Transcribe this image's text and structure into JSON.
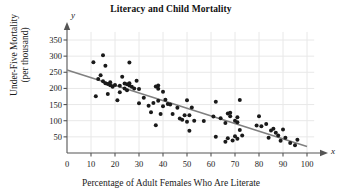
{
  "chart_data": {
    "type": "scatter",
    "title": "Literacy and Child Mortality",
    "xlabel": "Percentage of Adult Females Who Are Literate",
    "ylabel_line1": "Under-Five Mortality",
    "ylabel_line2": "(per thousand)",
    "x_axis_letter": "x",
    "y_axis_letter": "y",
    "xlim": [
      0,
      100
    ],
    "ylim": [
      0,
      375
    ],
    "xticks": [
      0,
      10,
      20,
      30,
      40,
      50,
      60,
      70,
      80,
      90,
      100
    ],
    "yticks": [
      50,
      100,
      150,
      200,
      250,
      300,
      350
    ],
    "grid": true,
    "legend": "none",
    "point_color": "#1a1a1a",
    "line_color": "#808080",
    "grid_color": "#e8e8e8",
    "axis_color": "#555555",
    "trendline": {
      "label": "least-squares regression line",
      "x": [
        0,
        100
      ],
      "y": [
        257,
        20
      ]
    },
    "points": [
      [
        11,
        281
      ],
      [
        12,
        176
      ],
      [
        13,
        229
      ],
      [
        14,
        241
      ],
      [
        15,
        303
      ],
      [
        15,
        222
      ],
      [
        16,
        270
      ],
      [
        16,
        216
      ],
      [
        17,
        183
      ],
      [
        17,
        214
      ],
      [
        18,
        219
      ],
      [
        18,
        210
      ],
      [
        19,
        205
      ],
      [
        20,
        211
      ],
      [
        21,
        163
      ],
      [
        22,
        188
      ],
      [
        22,
        208
      ],
      [
        23,
        236
      ],
      [
        24,
        215
      ],
      [
        24,
        200
      ],
      [
        25,
        213
      ],
      [
        25,
        194
      ],
      [
        26,
        280
      ],
      [
        26,
        216
      ],
      [
        26,
        209
      ],
      [
        27,
        205
      ],
      [
        28,
        200
      ],
      [
        29,
        224
      ],
      [
        30,
        198
      ],
      [
        30,
        154
      ],
      [
        32,
        171
      ],
      [
        34,
        146
      ],
      [
        35,
        126
      ],
      [
        36,
        155
      ],
      [
        37,
        86
      ],
      [
        37,
        206
      ],
      [
        38,
        209
      ],
      [
        38,
        199
      ],
      [
        38,
        162
      ],
      [
        39,
        121
      ],
      [
        40,
        190
      ],
      [
        40,
        145
      ],
      [
        41,
        165
      ],
      [
        42,
        152
      ],
      [
        43,
        150
      ],
      [
        44,
        121
      ],
      [
        46,
        140
      ],
      [
        47,
        107
      ],
      [
        48,
        103
      ],
      [
        49,
        117
      ],
      [
        50,
        163
      ],
      [
        50,
        97
      ],
      [
        51,
        69
      ],
      [
        51,
        117
      ],
      [
        52,
        141
      ],
      [
        53,
        100
      ],
      [
        57,
        99
      ],
      [
        61,
        113
      ],
      [
        62,
        159
      ],
      [
        62,
        50
      ],
      [
        64,
        108
      ],
      [
        66,
        93
      ],
      [
        66,
        35
      ],
      [
        67,
        46
      ],
      [
        67,
        122
      ],
      [
        68,
        125
      ],
      [
        68,
        114
      ],
      [
        69,
        39
      ],
      [
        70,
        100
      ],
      [
        70,
        52
      ],
      [
        71,
        111
      ],
      [
        71,
        95
      ],
      [
        71,
        44
      ],
      [
        72,
        164
      ],
      [
        72,
        71
      ],
      [
        73,
        54
      ],
      [
        79,
        85
      ],
      [
        80,
        114
      ],
      [
        81,
        83
      ],
      [
        83,
        90
      ],
      [
        84,
        47
      ],
      [
        85,
        70
      ],
      [
        86,
        75
      ],
      [
        87,
        63
      ],
      [
        88,
        54
      ],
      [
        89,
        38
      ],
      [
        90,
        73
      ],
      [
        91,
        47
      ],
      [
        93,
        31
      ],
      [
        95,
        24
      ],
      [
        96,
        41
      ]
    ]
  }
}
